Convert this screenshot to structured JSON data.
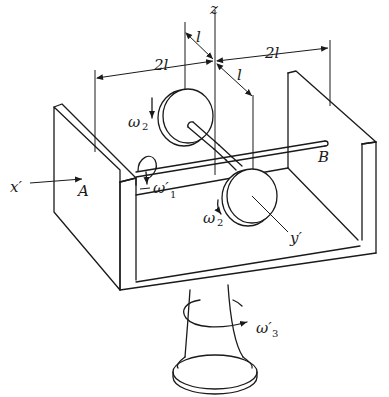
{
  "figure": {
    "labels": {
      "z_axis": "z",
      "x_axis": "x′",
      "y_axis": "y′",
      "point_a": "A",
      "point_b": "B",
      "dim_left": "2l",
      "dim_right": "2l",
      "dim_upper_l": "l",
      "dim_lower_l": "l",
      "omega2_top": "ω",
      "omega2_top_sub": "2",
      "omega1": "ω′",
      "omega1_sub": "1",
      "omega2_bottom": "ω",
      "omega2_bottom_sub": "2",
      "omega3": "ω′",
      "omega3_sub": "3"
    },
    "colors": {
      "line": "#1a1a1a",
      "background": "#ffffff"
    }
  }
}
